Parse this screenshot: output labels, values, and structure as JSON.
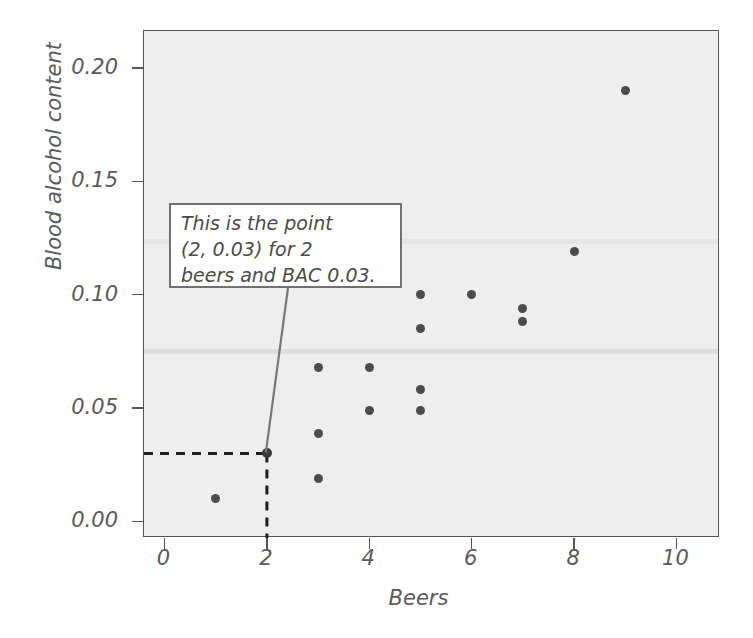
{
  "chart_data": {
    "type": "scatter",
    "title": "",
    "xlabel": "Beers",
    "ylabel": "Blood alcohol content",
    "xlim": [
      -0.4,
      10.85
    ],
    "ylim": [
      -0.0073,
      0.2163
    ],
    "xticks": [
      0,
      2,
      4,
      6,
      8,
      10
    ],
    "xticklabels": [
      "0",
      "2",
      "4",
      "6",
      "8",
      "10"
    ],
    "yticks": [
      0.0,
      0.05,
      0.1,
      0.15,
      0.2
    ],
    "yticklabels": [
      "0.00",
      "0.05",
      "0.10",
      "0.15",
      "0.20"
    ],
    "grid": false,
    "legend": null,
    "marker_color": "#4c4c4c",
    "plot_bg_color": "#eeeeee",
    "points": [
      {
        "x": 1,
        "y": 0.01
      },
      {
        "x": 2,
        "y": 0.03,
        "highlight": true
      },
      {
        "x": 3,
        "y": 0.068
      },
      {
        "x": 3,
        "y": 0.039
      },
      {
        "x": 3,
        "y": 0.019
      },
      {
        "x": 4,
        "y": 0.068
      },
      {
        "x": 4,
        "y": 0.049
      },
      {
        "x": 5,
        "y": 0.1
      },
      {
        "x": 5,
        "y": 0.085
      },
      {
        "x": 5,
        "y": 0.058
      },
      {
        "x": 5,
        "y": 0.049
      },
      {
        "x": 6,
        "y": 0.1
      },
      {
        "x": 7,
        "y": 0.094
      },
      {
        "x": 7,
        "y": 0.088
      },
      {
        "x": 8,
        "y": 0.119
      },
      {
        "x": 9,
        "y": 0.19
      }
    ],
    "annotation": {
      "text": "This is the point (2, 0.03) for 2 beers and BAC 0.03.",
      "lines": [
        "This is the point",
        "(2, 0.03) for 2",
        "beers and BAC 0.03."
      ],
      "target_point": {
        "x": 2,
        "y": 0.03
      },
      "guide_lines": "dashed"
    }
  }
}
